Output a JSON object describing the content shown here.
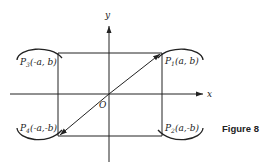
{
  "figure": {
    "caption": "Figure 8",
    "axes": {
      "x_label": "x",
      "y_label": "y",
      "origin_label": "O"
    },
    "points": [
      {
        "id": "P1",
        "name": "P",
        "subscript": "1",
        "coords": "(a, b)"
      },
      {
        "id": "P2",
        "name": "P",
        "subscript": "2",
        "coords": "(a,-b)"
      },
      {
        "id": "P3",
        "name": "P",
        "subscript": "3",
        "coords": "(-a, b)"
      },
      {
        "id": "P4",
        "name": "P",
        "subscript": "4",
        "coords": "(-a,-b)"
      }
    ],
    "diagonal": {
      "from": "P4",
      "to": "P1"
    }
  }
}
